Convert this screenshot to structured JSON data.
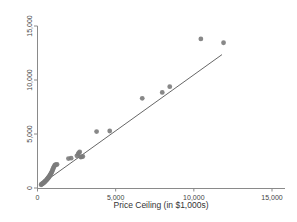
{
  "chart_data": {
    "type": "scatter",
    "title": "",
    "subtitle": "",
    "xlabel": "Price Ceiling (in $1,000s)",
    "ylabel": "",
    "xlim": [
      0,
      15000
    ],
    "ylim": [
      0,
      15000
    ],
    "xticks": [
      0,
      5000,
      10000,
      15000
    ],
    "yticks": [
      0,
      5000,
      10000,
      15000
    ],
    "xtick_labels": [
      "0",
      "5,000",
      "10,000",
      "15,000"
    ],
    "ytick_labels": [
      "0",
      "5,000",
      "10,000",
      "15,000"
    ],
    "grid": false,
    "legend": false,
    "legend_position": "none",
    "marker_color": "#7b7b7b",
    "line_color": "#555555",
    "axis_color": "#8a8a8a",
    "series": [
      {
        "name": "observations",
        "type": "scatter",
        "points": [
          [
            230,
            300
          ],
          [
            260,
            340
          ],
          [
            300,
            390
          ],
          [
            330,
            420
          ],
          [
            360,
            450
          ],
          [
            390,
            480
          ],
          [
            420,
            520
          ],
          [
            450,
            560
          ],
          [
            480,
            600
          ],
          [
            510,
            640
          ],
          [
            540,
            690
          ],
          [
            570,
            730
          ],
          [
            600,
            780
          ],
          [
            620,
            820
          ],
          [
            650,
            870
          ],
          [
            670,
            910
          ],
          [
            700,
            960
          ],
          [
            720,
            1010
          ],
          [
            750,
            1060
          ],
          [
            770,
            1110
          ],
          [
            800,
            1180
          ],
          [
            830,
            1250
          ],
          [
            860,
            1330
          ],
          [
            890,
            1420
          ],
          [
            920,
            1500
          ],
          [
            950,
            1600
          ],
          [
            980,
            1720
          ],
          [
            1010,
            1840
          ],
          [
            1050,
            1960
          ],
          [
            1090,
            2060
          ],
          [
            1130,
            2140
          ],
          [
            1180,
            2160
          ],
          [
            1250,
            2180
          ],
          [
            1980,
            2720
          ],
          [
            2150,
            2760
          ],
          [
            2520,
            2980
          ],
          [
            2600,
            3140
          ],
          [
            2640,
            3260
          ],
          [
            2700,
            3340
          ],
          [
            2760,
            2860
          ],
          [
            2830,
            2880
          ],
          [
            2900,
            2920
          ],
          [
            3780,
            5220
          ],
          [
            4620,
            5280
          ],
          [
            6700,
            8300
          ],
          [
            7980,
            8850
          ],
          [
            8460,
            9380
          ],
          [
            10450,
            13800
          ],
          [
            11900,
            13450
          ]
        ]
      },
      {
        "name": "fit-line",
        "type": "line",
        "endpoints": [
          [
            170,
            280
          ],
          [
            11800,
            12350
          ]
        ]
      }
    ]
  },
  "axes": {
    "x_axis_name": "x-axis",
    "y_axis_name": "y-axis"
  }
}
